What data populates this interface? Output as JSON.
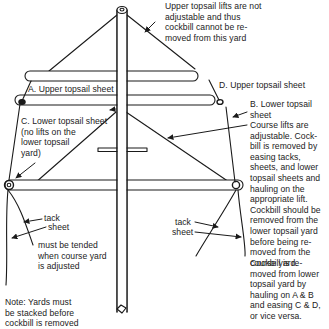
{
  "diagram": {
    "colors": {
      "ink": "#1a1a1a",
      "background": "#ffffff"
    },
    "labels": {
      "upper_note": "Upper topsail lifts are not\nadjustable and thus\ncockbill cannot be re-\nmoved from this yard",
      "a_upper_topsail_sheet": "A. Upper topsail sheet",
      "d_upper_topsail_sheet": "D. Upper topsail sheet",
      "b_lower_topsail_sheet": "B. Lower topsail\nsheet",
      "c_lower_topsail_sheet": "C. Lower topsail sheet\n(no lifts on the\nlower topsail\nyard)",
      "course_lifts_note": "Course lifts are\nadjustable. Cock-\nbill is removed by\neasing tacks,\nsheets, and lower\ntopsail sheets and\nhauling on the\nappropriate lift.\nCockbill should be\nremoved from the\nlower topsail yard\nbefore being re-\nmoved from the\ncourse yard.",
      "cockbill_lower_note": "Cockbill is re-\nmoved from lower\ntopsail yard by\nhauling on A & B\nand easing C & D,\nor vice versa.",
      "left_tack": "tack",
      "left_sheet": "sheet",
      "must_be_tended": "must be tended\nwhen course yard\nis adjusted",
      "right_tack": "tack",
      "right_sheet": "sheet",
      "stacking_note": "Note: Yards must\nbe stacked before\ncockbill is removed"
    },
    "elements": [
      "mast",
      "upper-topsail-yard",
      "lower-topsail-yard",
      "course-yard",
      "upper-topsail-lifts",
      "course-lifts",
      "sheet-lines",
      "tack-lines",
      "pointer-arrows"
    ]
  }
}
